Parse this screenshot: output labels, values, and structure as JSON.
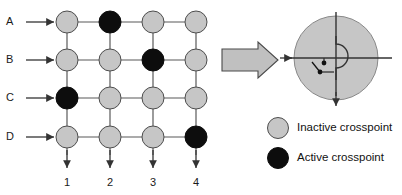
{
  "figure": {
    "title_visible": false,
    "background_color": "#ffffff",
    "palette": {
      "inactive_fill": "#c6c6c6",
      "active_fill": "#0d0d0d",
      "node_stroke": "#4d4d4d",
      "wire_stroke": "#595959",
      "arrow_stroke": "#333333",
      "big_arrow_fill": "#c0c0c0",
      "big_arrow_stroke": "#4a4a4a",
      "text_color": "#111111"
    }
  },
  "matrix": {
    "row_labels": [
      "A",
      "B",
      "C",
      "D"
    ],
    "column_labels": [
      "1",
      "2",
      "3",
      "4"
    ],
    "row_centers_y": [
      22,
      60,
      98,
      137
    ],
    "column_centers_x": [
      67,
      110,
      153,
      196
    ],
    "node_radius": 11,
    "states": [
      [
        "inactive",
        "active",
        "inactive",
        "inactive"
      ],
      [
        "inactive",
        "inactive",
        "active",
        "inactive"
      ],
      [
        "active",
        "inactive",
        "inactive",
        "inactive"
      ],
      [
        "inactive",
        "inactive",
        "inactive",
        "active"
      ]
    ],
    "active_cells": [
      "A2",
      "B3",
      "C1",
      "D4"
    ]
  },
  "transition_arrow": {
    "name": "block-arrow",
    "direction": "right",
    "x": 222,
    "y": 55,
    "width": 56,
    "height": 22
  },
  "crosspoint_detail": {
    "center_x": 336,
    "center_y": 58,
    "radius": 42,
    "fill": "#c6c6c6",
    "has_vertical_line": true,
    "has_horizontal_line": true,
    "input_arrow_direction": "right",
    "output_arrow_direction": "down",
    "switch_contacts": 2
  },
  "legend": {
    "items": [
      {
        "swatch": "inactive",
        "label": "Inactive crosspoint",
        "cx": 278,
        "cy": 128
      },
      {
        "swatch": "active",
        "label": "Active crosspoint",
        "cx": 278,
        "cy": 158
      }
    ]
  }
}
